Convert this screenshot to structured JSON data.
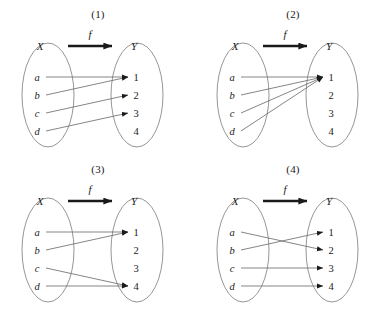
{
  "figure": {
    "title_visible": false,
    "background_color": "#ffffff",
    "stroke_color": "#6f6f6f",
    "ellipse_color": "#8a8a8a",
    "text_color": "#1a1a1a"
  },
  "common": {
    "domain_label": "X",
    "codomain_label": "Y",
    "map_label": "f",
    "domain_elements": [
      "a",
      "b",
      "c",
      "d"
    ],
    "codomain_elements": [
      "1",
      "2",
      "3",
      "4"
    ]
  },
  "panels": [
    {
      "caption": "(1)",
      "domain_label": "X",
      "codomain_label": "Y",
      "map_label": "f",
      "domain_elements": [
        "a",
        "b",
        "c",
        "d"
      ],
      "codomain_elements": [
        "1",
        "2",
        "3",
        "4"
      ],
      "mappings": [
        {
          "from": "a",
          "to": "1"
        },
        {
          "from": "b",
          "to": "1"
        },
        {
          "from": "c",
          "to": "2"
        },
        {
          "from": "d",
          "to": "3"
        }
      ],
      "unmapped_codomain": [
        "4"
      ]
    },
    {
      "caption": "(2)",
      "domain_label": "X",
      "codomain_label": "Y",
      "map_label": "f",
      "domain_elements": [
        "a",
        "b",
        "c",
        "d"
      ],
      "codomain_elements": [
        "1",
        "2",
        "3",
        "4"
      ],
      "mappings": [
        {
          "from": "a",
          "to": "1"
        },
        {
          "from": "b",
          "to": "1"
        },
        {
          "from": "c",
          "to": "1"
        },
        {
          "from": "d",
          "to": "1"
        }
      ],
      "unmapped_codomain": [
        "2",
        "3",
        "4"
      ]
    },
    {
      "caption": "(3)",
      "domain_label": "X",
      "codomain_label": "Y",
      "map_label": "f",
      "domain_elements": [
        "a",
        "b",
        "c",
        "d"
      ],
      "codomain_elements": [
        "1",
        "2",
        "3",
        "4"
      ],
      "mappings": [
        {
          "from": "a",
          "to": "1"
        },
        {
          "from": "b",
          "to": "1"
        },
        {
          "from": "c",
          "to": "4"
        },
        {
          "from": "d",
          "to": "4"
        }
      ],
      "unmapped_codomain": [
        "2",
        "3"
      ]
    },
    {
      "caption": "(4)",
      "domain_label": "X",
      "codomain_label": "Y",
      "map_label": "f",
      "domain_elements": [
        "a",
        "b",
        "c",
        "d"
      ],
      "codomain_elements": [
        "1",
        "2",
        "3",
        "4"
      ],
      "mappings": [
        {
          "from": "a",
          "to": "2"
        },
        {
          "from": "b",
          "to": "1"
        },
        {
          "from": "c",
          "to": "3"
        },
        {
          "from": "d",
          "to": "4"
        }
      ],
      "unmapped_codomain": []
    }
  ]
}
